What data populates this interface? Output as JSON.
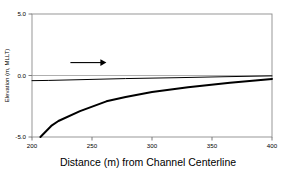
{
  "chart_data": {
    "type": "line",
    "title": "",
    "xlabel": "Distance (m) from Channel Centerline",
    "ylabel": "Elevation (m, MLLT)",
    "xlim": [
      200,
      400
    ],
    "ylim": [
      -5.0,
      5.0
    ],
    "xticks": [
      200,
      250,
      300,
      350,
      400
    ],
    "xticklabels": [
      "200",
      "250",
      "300",
      "350",
      "400"
    ],
    "yticks": [
      5.0,
      0.0,
      -5.0
    ],
    "yticklabels": [
      "5.0",
      "0.0",
      "-5.0"
    ],
    "grid": false,
    "legend": "none",
    "series": [
      {
        "name": "water-surface",
        "style": "thin",
        "x": [
          200,
          214,
          240,
          278,
          320,
          360,
          400
        ],
        "y": [
          -0.42,
          -0.4,
          -0.34,
          -0.25,
          -0.18,
          -0.1,
          -0.03
        ]
      },
      {
        "name": "channel-bed",
        "style": "thick",
        "x": [
          207,
          216,
          222,
          240,
          262,
          278,
          300,
          330,
          365,
          400
        ],
        "y": [
          -5.0,
          -4.1,
          -3.7,
          -2.9,
          -2.1,
          -1.75,
          -1.35,
          -0.95,
          -0.58,
          -0.28
        ]
      }
    ],
    "annotations": [
      {
        "name": "flow-direction-arrow",
        "type": "arrow",
        "direction": "right",
        "x_start": 232,
        "x_end": 262,
        "y": 1.05,
        "label": ""
      }
    ]
  },
  "axis": {
    "x_title": "Distance (m) from Channel Centerline",
    "y_title": "Elevation (m, MLLT)",
    "x_tick_0": "200",
    "x_tick_1": "250",
    "x_tick_2": "300",
    "x_tick_3": "350",
    "x_tick_4": "400",
    "y_tick_0": "5.0",
    "y_tick_1": "0.0",
    "y_tick_2": "-5.0"
  },
  "colors": {
    "frame": "#808080",
    "line": "#000000",
    "background": "#ffffff",
    "text": "#000000"
  }
}
